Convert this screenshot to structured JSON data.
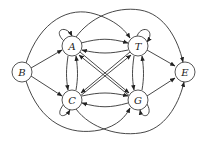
{
  "diagram": {
    "type": "state-transition-graph",
    "nodes": [
      {
        "id": "B",
        "label": "B",
        "x": 22,
        "y": 72
      },
      {
        "id": "A",
        "label": "A",
        "x": 72,
        "y": 46
      },
      {
        "id": "T",
        "label": "T",
        "x": 138,
        "y": 46
      },
      {
        "id": "C",
        "label": "C",
        "x": 72,
        "y": 100
      },
      {
        "id": "G",
        "label": "G",
        "x": 138,
        "y": 100
      },
      {
        "id": "E",
        "label": "E",
        "x": 185,
        "y": 72
      }
    ],
    "edges": [
      {
        "from": "B",
        "to": "A"
      },
      {
        "from": "B",
        "to": "C"
      },
      {
        "from": "B",
        "to": "T"
      },
      {
        "from": "B",
        "to": "G"
      },
      {
        "from": "A",
        "to": "A"
      },
      {
        "from": "T",
        "to": "T"
      },
      {
        "from": "C",
        "to": "C"
      },
      {
        "from": "G",
        "to": "G"
      },
      {
        "from": "A",
        "to": "T"
      },
      {
        "from": "T",
        "to": "A"
      },
      {
        "from": "A",
        "to": "C"
      },
      {
        "from": "C",
        "to": "A"
      },
      {
        "from": "A",
        "to": "G"
      },
      {
        "from": "G",
        "to": "A"
      },
      {
        "from": "T",
        "to": "C"
      },
      {
        "from": "C",
        "to": "T"
      },
      {
        "from": "T",
        "to": "G"
      },
      {
        "from": "G",
        "to": "T"
      },
      {
        "from": "C",
        "to": "G"
      },
      {
        "from": "G",
        "to": "C"
      },
      {
        "from": "A",
        "to": "E"
      },
      {
        "from": "T",
        "to": "E"
      },
      {
        "from": "C",
        "to": "E"
      },
      {
        "from": "G",
        "to": "E"
      }
    ],
    "colors": {
      "stroke": "#333333",
      "fill": "#ffffff"
    }
  }
}
